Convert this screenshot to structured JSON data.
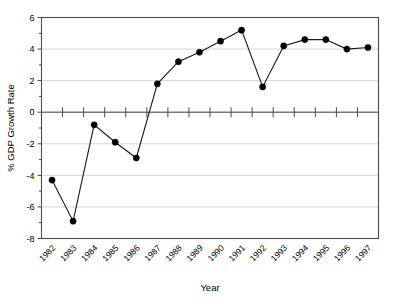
{
  "chart_data": {
    "type": "line",
    "title": "",
    "subtitle": "",
    "xlabel": "Year",
    "ylabel": "% GDP Growth Rate",
    "categories": [
      "1982",
      "1983",
      "1984",
      "1985",
      "1986",
      "1987",
      "1988",
      "1989",
      "1990",
      "1991",
      "1992",
      "1993",
      "1994",
      "1995",
      "1996",
      "1997"
    ],
    "values": [
      -4.3,
      -6.9,
      -0.8,
      -1.9,
      -2.9,
      1.8,
      3.2,
      3.8,
      4.5,
      5.2,
      1.6,
      4.2,
      4.6,
      4.6,
      4.0,
      4.1
    ],
    "ylim": [
      -8,
      6
    ],
    "ytick_labels": [
      "6",
      "4",
      "2",
      "0",
      "-2",
      "-4",
      "-6",
      "-8"
    ],
    "ytick_values": [
      6,
      4,
      2,
      0,
      -2,
      -4,
      -6,
      -8
    ],
    "grid": true,
    "legend": "none",
    "legend_position": "none",
    "marker": "filled-circle",
    "line_color": "#1a1a1a",
    "marker_color": "#000000",
    "grid_color": "#c9c9c9",
    "zero_line_color": "#7a7a7a",
    "frame_color": "#4a4a4a",
    "background_color": "#ffffff",
    "xtick_rotation": 45
  }
}
